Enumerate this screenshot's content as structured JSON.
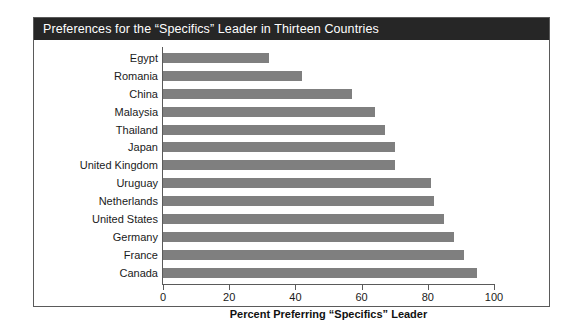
{
  "figure": {
    "title": "Preferences for the “Specifics” Leader in Thirteen Countries"
  },
  "chart_data": {
    "type": "bar",
    "orientation": "horizontal",
    "title": "Preferences for the “Specifics” Leader in Thirteen Countries",
    "xlabel": "Percent Preferring “Specifics” Leader",
    "ylabel": "",
    "categories": [
      "Egypt",
      "Romania",
      "China",
      "Malaysia",
      "Thailand",
      "Japan",
      "United Kingdom",
      "Uruguay",
      "Netherlands",
      "United States",
      "Germany",
      "France",
      "Canada"
    ],
    "values": [
      32,
      42,
      57,
      64,
      67,
      70,
      70,
      81,
      82,
      85,
      88,
      91,
      95
    ],
    "xlim": [
      0,
      100
    ],
    "xticks": [
      0,
      20,
      40,
      60,
      80,
      100
    ],
    "xtick_labels": [
      "0",
      "20",
      "40",
      "60",
      "80",
      "100"
    ],
    "grid": false,
    "legend": false,
    "bar_color": "#7f7f7f",
    "title_bar_color": "#262626",
    "title_text_color": "#ffffff",
    "frame_color": "#5a5a5a",
    "background_color": "#ffffff"
  }
}
